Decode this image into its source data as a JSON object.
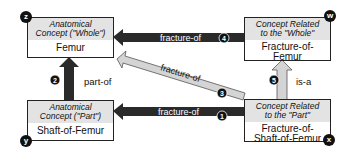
{
  "nodes": {
    "whole": {
      "header_line1": "Anatomical",
      "header_line2": "Concept (\"Whole\")",
      "name_line1": "Femur",
      "badge": "z"
    },
    "part": {
      "header_line1": "Anatomical",
      "header_line2": "Concept (\"Part\")",
      "name_line1": "Shaft-of-Femur",
      "badge": "y"
    },
    "related_whole": {
      "header_line1": "Concept Related",
      "header_line2": "to the \"Whole\"",
      "name_line1": "Fracture-of-",
      "name_line2": "Femur",
      "badge": "w"
    },
    "related_part": {
      "header_line1": "Concept Related",
      "header_line2": "to the \"Part\"",
      "name_line1": "Fracture-of-",
      "name_line2": "Shaft-of-Femur",
      "badge": "x"
    }
  },
  "edges": [
    {
      "id": "1",
      "label": "fracture-of",
      "from": "related_part",
      "to": "part",
      "style": "dark"
    },
    {
      "id": "2",
      "label": "part-of",
      "from": "part",
      "to": "whole",
      "style": "dark"
    },
    {
      "id": "3",
      "label": "fracture-of",
      "from": "related_part",
      "to": "whole",
      "style": "light"
    },
    {
      "id": "4",
      "label": "fracture-of",
      "from": "related_whole",
      "to": "whole",
      "style": "dark"
    },
    {
      "id": "5",
      "label": "is-a",
      "from": "related_part",
      "to": "related_whole",
      "style": "light"
    }
  ],
  "colors": {
    "dark_arrow": "#2a2a2a",
    "light_arrow": "#d4d4d4",
    "header_bg": "#e3e3e3"
  }
}
